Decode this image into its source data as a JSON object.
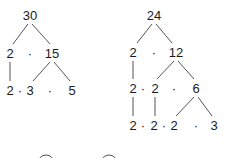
{
  "trees": [
    {
      "name": "factor-tree-30",
      "nodes": [
        {
          "id": "n30",
          "text": "30",
          "x": 30,
          "y": 15
        },
        {
          "id": "n2a",
          "text": "2",
          "x": 10,
          "y": 53
        },
        {
          "id": "d1",
          "text": "·",
          "x": 30,
          "y": 53,
          "dot": true
        },
        {
          "id": "n15",
          "text": "15",
          "x": 52,
          "y": 53
        },
        {
          "id": "n2b",
          "text": "2",
          "x": 10,
          "y": 90
        },
        {
          "id": "d2",
          "text": "·",
          "x": 20,
          "y": 90,
          "dot": true
        },
        {
          "id": "n3",
          "text": "3",
          "x": 30,
          "y": 90
        },
        {
          "id": "d3",
          "text": "·",
          "x": 50,
          "y": 90,
          "dot": true
        },
        {
          "id": "n5",
          "text": "5",
          "x": 72,
          "y": 90
        }
      ],
      "edges": [
        [
          28,
          24,
          13,
          44
        ],
        [
          32,
          24,
          50,
          44
        ],
        [
          10,
          62,
          10,
          81
        ],
        [
          50,
          62,
          33,
          81
        ],
        [
          54,
          62,
          70,
          81
        ]
      ]
    },
    {
      "name": "factor-tree-24",
      "nodes": [
        {
          "id": "m24",
          "text": "24",
          "x": 154,
          "y": 15
        },
        {
          "id": "m2a",
          "text": "2",
          "x": 133,
          "y": 52
        },
        {
          "id": "e1",
          "text": "·",
          "x": 154,
          "y": 52,
          "dot": true
        },
        {
          "id": "m12",
          "text": "12",
          "x": 176,
          "y": 52
        },
        {
          "id": "m2b",
          "text": "2",
          "x": 133,
          "y": 88
        },
        {
          "id": "e2",
          "text": "·",
          "x": 143,
          "y": 88,
          "dot": true
        },
        {
          "id": "m2c",
          "text": "2",
          "x": 155,
          "y": 88
        },
        {
          "id": "e3",
          "text": "·",
          "x": 174,
          "y": 88,
          "dot": true
        },
        {
          "id": "m6",
          "text": "6",
          "x": 196,
          "y": 88
        },
        {
          "id": "m2d",
          "text": "2",
          "x": 133,
          "y": 125
        },
        {
          "id": "e4",
          "text": "·",
          "x": 143,
          "y": 125,
          "dot": true
        },
        {
          "id": "m2e",
          "text": "2",
          "x": 154,
          "y": 125
        },
        {
          "id": "e5",
          "text": "·",
          "x": 164,
          "y": 125,
          "dot": true
        },
        {
          "id": "m2f",
          "text": "2",
          "x": 174,
          "y": 125
        },
        {
          "id": "e6",
          "text": "·",
          "x": 196,
          "y": 125,
          "dot": true
        },
        {
          "id": "m3",
          "text": "3",
          "x": 214,
          "y": 125
        }
      ],
      "edges": [
        [
          152,
          24,
          137,
          43
        ],
        [
          156,
          24,
          172,
          43
        ],
        [
          133,
          61,
          133,
          79
        ],
        [
          174,
          61,
          157,
          79
        ],
        [
          178,
          61,
          194,
          79
        ],
        [
          133,
          97,
          133,
          116
        ],
        [
          155,
          97,
          155,
          116
        ],
        [
          194,
          97,
          176,
          116
        ],
        [
          198,
          97,
          212,
          116
        ]
      ]
    }
  ],
  "circles": [
    {
      "name": "partial-circle-1",
      "cx": 46,
      "cy": 163,
      "r": 8
    },
    {
      "name": "partial-circle-2",
      "cx": 109,
      "cy": 163,
      "r": 8
    }
  ]
}
